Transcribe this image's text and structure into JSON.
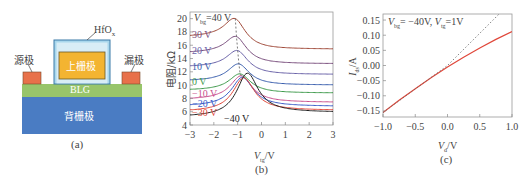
{
  "panel_a": {
    "caption": "(a)",
    "layers": {
      "source": "源极",
      "drain": "漏极",
      "top_gate": "上栅极",
      "dielectric": "HfO",
      "dielectric_sub": "x",
      "channel": "BLG",
      "back_gate": "背栅极"
    },
    "colors": {
      "contacts": "#e8714a",
      "top_gate": "#f3b431",
      "dielectric": "#a9d7ec",
      "channel": "#98c56a",
      "back_gate": "#4a7cc3"
    }
  },
  "panel_b": {
    "caption": "(b)",
    "ylabel": "电阻/kΩ",
    "xlabel_main": "V",
    "xlabel_sub": "tg",
    "xlabel_unit": "/V",
    "top_label_prefix": "V",
    "top_label_sub": "bg",
    "curve_labels": [
      "=40 V",
      "30 V",
      "20 V",
      "10 V",
      "0 V",
      "−10 V",
      "−20 V",
      "−30 V",
      "−40 V"
    ],
    "yticks": [
      "20",
      "18",
      "16",
      "14",
      "12",
      "10",
      "8",
      "6",
      "4"
    ],
    "xticks": [
      "−3",
      "−2",
      "−1",
      "0",
      "1",
      "2",
      "3"
    ]
  },
  "panel_c": {
    "caption": "(c)",
    "ylabel_main": "I",
    "ylabel_sub": "ds",
    "ylabel_unit": "/A",
    "xlabel_main": "V",
    "xlabel_sub": "d",
    "xlabel_unit": "/V",
    "annotation": "V_bg= −40V, V_tg=1V",
    "annotation_parts": {
      "v1": "V",
      "s1": "bg",
      "t1": "= −40V, ",
      "v2": "V",
      "s2": "tg",
      "t2": "=1V"
    },
    "yticks": [
      "0.15",
      "0.10",
      "0.05",
      "0.00",
      "−0.05",
      "−0.10",
      "−0.15"
    ],
    "xticks": [
      "−1.0",
      "−0.5",
      "0.0",
      "0.5",
      "1.0"
    ]
  },
  "chart_data": [
    {
      "type": "line",
      "title": "(b) Resistance vs top-gate voltage at various back-gate voltages",
      "xlabel": "V_tg / V",
      "ylabel": "电阻 / kΩ",
      "xlim": [
        -3,
        3
      ],
      "ylim": [
        4,
        21
      ],
      "grid": false,
      "annotations": [
        "dashed line tracing peak positions"
      ],
      "series": [
        {
          "name": "V_bg=40 V",
          "color": "#a04a3a",
          "peak_x": -1.1,
          "peak_y": 20.0,
          "left_y": 17.2,
          "right_y": 15.4
        },
        {
          "name": "30 V",
          "color": "#7a4f7e",
          "peak_x": -1.05,
          "peak_y": 17.3,
          "left_y": 14.8,
          "right_y": 13.2
        },
        {
          "name": "20 V",
          "color": "#6a62a8",
          "peak_x": -1.0,
          "peak_y": 15.2,
          "left_y": 12.7,
          "right_y": 11.6
        },
        {
          "name": "10 V",
          "color": "#3b5fae",
          "peak_x": -0.95,
          "peak_y": 13.2,
          "left_y": 10.6,
          "right_y": 10.0
        },
        {
          "name": "0 V",
          "color": "#3f9a4c",
          "peak_x": -0.9,
          "peak_y": 11.7,
          "left_y": 9.2,
          "right_y": 8.8
        },
        {
          "name": "-10 V",
          "color": "#c9508e",
          "peak_x": -0.85,
          "peak_y": 11.4,
          "left_y": 7.8,
          "right_y": 7.4
        },
        {
          "name": "-20 V",
          "color": "#3a5cc8",
          "peak_x": -0.8,
          "peak_y": 11.2,
          "left_y": 6.8,
          "right_y": 6.8
        },
        {
          "name": "-30 V",
          "color": "#e0473a",
          "peak_x": -0.75,
          "peak_y": 11.1,
          "left_y": 6.0,
          "right_y": 6.2
        },
        {
          "name": "-40 V",
          "color": "#222222",
          "peak_x": -0.6,
          "peak_y": 11.8,
          "left_y": 5.2,
          "right_y": 5.9
        }
      ]
    },
    {
      "type": "line",
      "title": "(c) I_ds vs V_d at V_bg=-40V, V_tg=1V",
      "xlabel": "V_d / V",
      "ylabel": "I_ds / A",
      "xlim": [
        -1.0,
        1.0
      ],
      "ylim": [
        -0.17,
        0.17
      ],
      "grid": false,
      "series": [
        {
          "name": "measured",
          "color": "#e0473a",
          "style": "solid",
          "x": [
            -1.0,
            -0.75,
            -0.5,
            -0.25,
            0.0,
            0.25,
            0.5,
            0.75,
            1.0
          ],
          "y": [
            -0.155,
            -0.115,
            -0.077,
            -0.04,
            -0.005,
            0.027,
            0.058,
            0.086,
            0.112
          ]
        },
        {
          "name": "linear reference",
          "color": "#666666",
          "style": "dotted",
          "x": [
            -1.0,
            0.0,
            0.8
          ],
          "y": [
            -0.155,
            0.0,
            0.17
          ]
        }
      ]
    }
  ]
}
